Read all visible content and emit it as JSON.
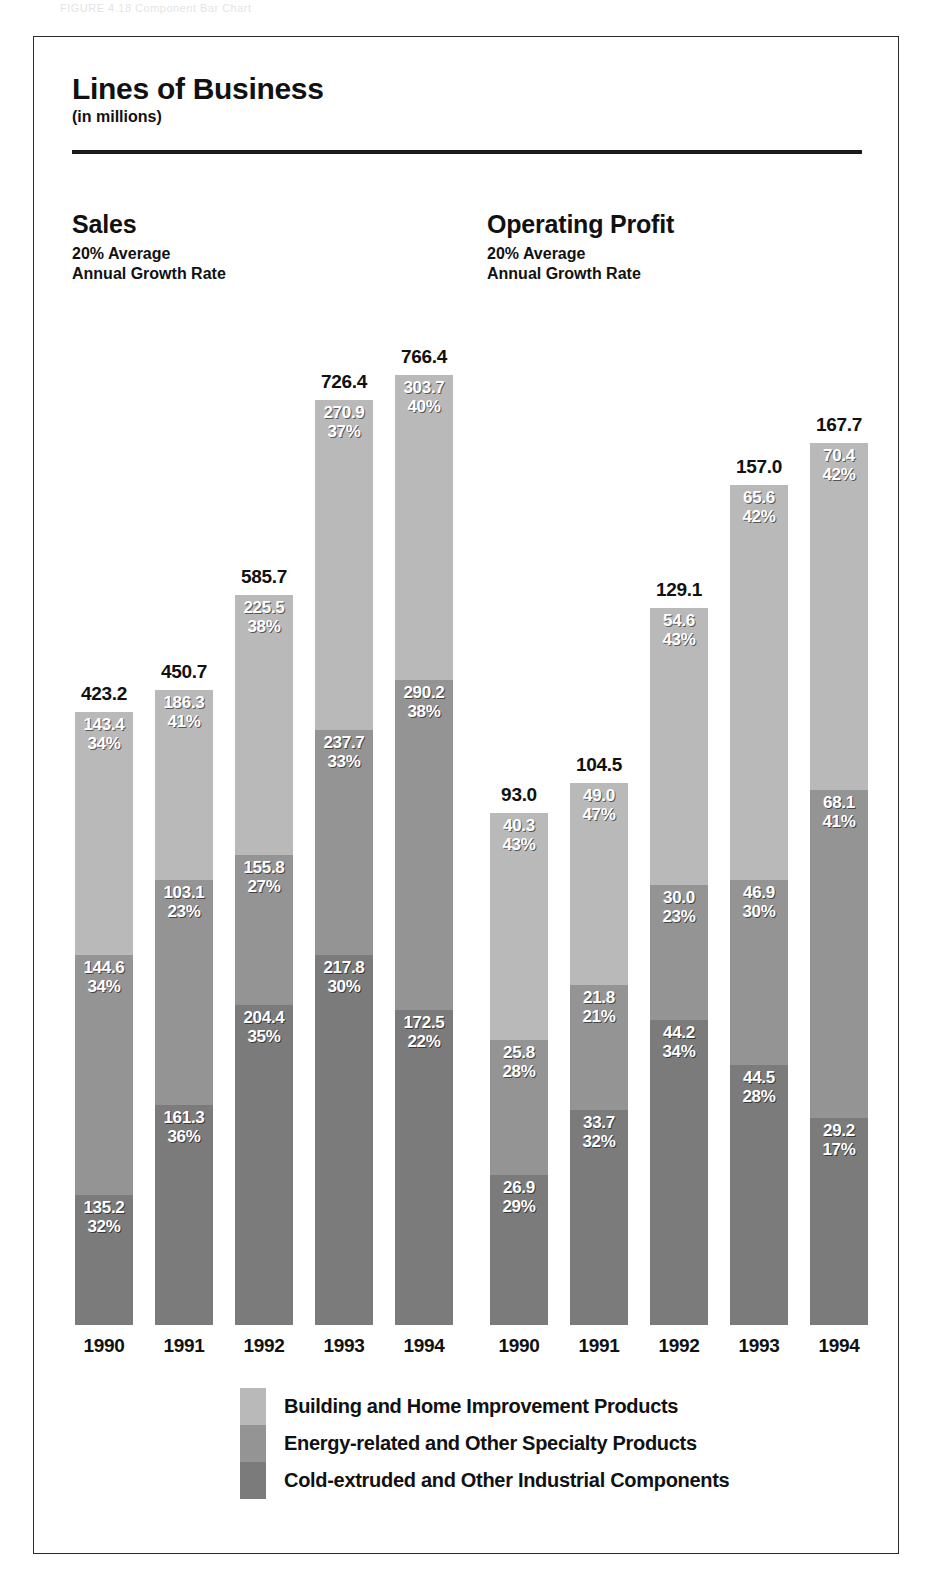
{
  "page_header_faint": "FIGURE 4.18   Component Bar Chart",
  "card": {
    "title": "Lines of Business",
    "subtitle": "(in millions)"
  },
  "panels": [
    {
      "title": "Sales",
      "sub_line1": "20% Average",
      "sub_line2": "Annual Growth Rate"
    },
    {
      "title": "Operating Profit",
      "sub_line1": "20% Average",
      "sub_line2": "Annual Growth Rate"
    }
  ],
  "legend": [
    {
      "label": "Building and Home Improvement Products",
      "color": "#b9b9b9"
    },
    {
      "label": "Energy-related and Other Specialty Products",
      "color": "#949494"
    },
    {
      "label": "Cold-extruded and Other Industrial Components",
      "color": "#7b7b7b"
    }
  ],
  "chart_data": {
    "type": "bar",
    "title": "Lines of Business",
    "subtitle": "(in millions)",
    "stacked": true,
    "units": "millions of dollars",
    "grid": false,
    "legend_position": "bottom",
    "series": [
      {
        "name": "Building and Home Improvement Products",
        "color": "#b9b9b9"
      },
      {
        "name": "Energy-related and Other Specialty Products",
        "color": "#949494"
      },
      {
        "name": "Cold-extruded and Other Industrial Components",
        "color": "#7b7b7b"
      }
    ],
    "panels": [
      {
        "name": "Sales",
        "note": "20% Average Annual Growth Rate",
        "categories": [
          "1990",
          "1991",
          "1992",
          "1993",
          "1994"
        ],
        "totals": [
          "423.2",
          "450.7",
          "585.7",
          "726.4",
          "766.4"
        ],
        "totals_numeric": [
          423.2,
          450.7,
          585.7,
          726.4,
          766.4
        ],
        "stacks": [
          {
            "category": "1990",
            "total": "423.2",
            "segments": [
              {
                "series": "Building and Home Improvement Products",
                "value": "143.4",
                "percent": "34%"
              },
              {
                "series": "Energy-related and Other Specialty Products",
                "value": "144.6",
                "percent": "34%"
              },
              {
                "series": "Cold-extruded and Other Industrial Components",
                "value": "135.2",
                "percent": "32%"
              }
            ]
          },
          {
            "category": "1991",
            "total": "450.7",
            "segments": [
              {
                "series": "Building and Home Improvement Products",
                "value": "186.3",
                "percent": "41%"
              },
              {
                "series": "Energy-related and Other Specialty Products",
                "value": "103.1",
                "percent": "23%"
              },
              {
                "series": "Cold-extruded and Other Industrial Components",
                "value": "161.3",
                "percent": "36%"
              }
            ]
          },
          {
            "category": "1992",
            "total": "585.7",
            "segments": [
              {
                "series": "Building and Home Improvement Products",
                "value": "225.5",
                "percent": "38%"
              },
              {
                "series": "Energy-related and Other Specialty Products",
                "value": "155.8",
                "percent": "27%"
              },
              {
                "series": "Cold-extruded and Other Industrial Components",
                "value": "204.4",
                "percent": "35%"
              }
            ]
          },
          {
            "category": "1993",
            "total": "726.4",
            "segments": [
              {
                "series": "Building and Home Improvement Products",
                "value": "270.9",
                "percent": "37%"
              },
              {
                "series": "Energy-related and Other Specialty Products",
                "value": "237.7",
                "percent": "33%"
              },
              {
                "series": "Cold-extruded and Other Industrial Components",
                "value": "217.8",
                "percent": "30%"
              }
            ]
          },
          {
            "category": "1994",
            "total": "766.4",
            "segments": [
              {
                "series": "Building and Home Improvement Products",
                "value": "303.7",
                "percent": "40%"
              },
              {
                "series": "Energy-related and Other Specialty Products",
                "value": "290.2",
                "percent": "38%"
              },
              {
                "series": "Cold-extruded and Other Industrial Components",
                "value": "172.5",
                "percent": "22%"
              }
            ]
          }
        ]
      },
      {
        "name": "Operating Profit",
        "note": "20% Average Annual Growth Rate",
        "categories": [
          "1990",
          "1991",
          "1992",
          "1993",
          "1994"
        ],
        "totals": [
          "93.0",
          "104.5",
          "129.1",
          "157.0",
          "167.7"
        ],
        "totals_numeric": [
          93.0,
          104.5,
          129.1,
          157.0,
          167.7
        ],
        "stacks": [
          {
            "category": "1990",
            "total": "93.0",
            "segments": [
              {
                "series": "Building and Home Improvement Products",
                "value": "40.3",
                "percent": "43%"
              },
              {
                "series": "Energy-related and Other Specialty Products",
                "value": "25.8",
                "percent": "28%"
              },
              {
                "series": "Cold-extruded and Other Industrial Components",
                "value": "26.9",
                "percent": "29%"
              }
            ]
          },
          {
            "category": "1991",
            "total": "104.5",
            "segments": [
              {
                "series": "Building and Home Improvement Products",
                "value": "49.0",
                "percent": "47%"
              },
              {
                "series": "Energy-related and Other Specialty Products",
                "value": "21.8",
                "percent": "21%"
              },
              {
                "series": "Cold-extruded and Other Industrial Components",
                "value": "33.7",
                "percent": "32%"
              }
            ]
          },
          {
            "category": "1992",
            "total": "129.1",
            "segments": [
              {
                "series": "Building and Home Improvement Products",
                "value": "54.6",
                "percent": "43%"
              },
              {
                "series": "Energy-related and Other Specialty Products",
                "value": "30.0",
                "percent": "23%"
              },
              {
                "series": "Cold-extruded and Other Industrial Components",
                "value": "44.2",
                "percent": "34%"
              }
            ]
          },
          {
            "category": "1993",
            "total": "157.0",
            "segments": [
              {
                "series": "Building and Home Improvement Products",
                "value": "65.6",
                "percent": "42%"
              },
              {
                "series": "Energy-related and Other Specialty Products",
                "value": "46.9",
                "percent": "30%"
              },
              {
                "series": "Cold-extruded and Other Industrial Components",
                "value": "44.5",
                "percent": "28%"
              }
            ]
          },
          {
            "category": "1994",
            "total": "167.7",
            "segments": [
              {
                "series": "Building and Home Improvement Products",
                "value": "70.4",
                "percent": "42%"
              },
              {
                "series": "Energy-related and Other Specialty Products",
                "value": "68.1",
                "percent": "41%"
              },
              {
                "series": "Cold-extruded and Other Industrial Components",
                "value": "29.2",
                "percent": "17%"
              }
            ]
          }
        ]
      }
    ]
  },
  "geometry": {
    "baseline_y": 1325,
    "bar_width": 58,
    "panel_x": [
      [
        75,
        155,
        235,
        315,
        395
      ],
      [
        490,
        570,
        650,
        730,
        810
      ]
    ],
    "bar_tops": [
      [
        712,
        690,
        595,
        400,
        375
      ],
      [
        813,
        783,
        608,
        485,
        443
      ]
    ],
    "seg_boundaries": [
      [
        [
          712,
          955,
          1195
        ],
        [
          690,
          880,
          1105
        ],
        [
          595,
          855,
          1005
        ],
        [
          400,
          730,
          955
        ],
        [
          375,
          680,
          1010
        ]
      ],
      [
        [
          813,
          1040,
          1175
        ],
        [
          783,
          985,
          1110
        ],
        [
          608,
          885,
          1020
        ],
        [
          485,
          880,
          1065
        ],
        [
          443,
          790,
          1118
        ]
      ]
    ]
  }
}
